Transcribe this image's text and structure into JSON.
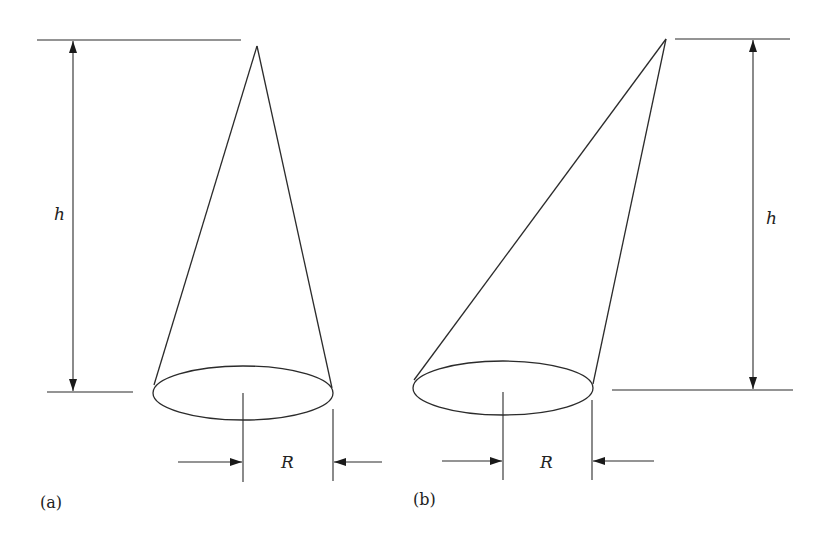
{
  "figure": {
    "panels": [
      {
        "id": "a",
        "caption": "(a)",
        "type": "right cone",
        "height_label": "h",
        "radius_label": "R"
      },
      {
        "id": "b",
        "caption": "(b)",
        "type": "oblique cone",
        "height_label": "h",
        "radius_label": "R"
      }
    ]
  },
  "colors": {
    "stroke": "#2b2b2b",
    "background": "#ffffff"
  }
}
